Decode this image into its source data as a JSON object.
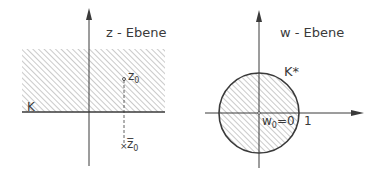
{
  "left_diagram": {
    "plane_label": "z - Ebene",
    "boundary_label": "K",
    "point_label": "z",
    "point_subscript": "0",
    "mirror_label": "z̅",
    "mirror_subscript": "0"
  },
  "right_diagram": {
    "plane_label": "w - Ebene",
    "boundary_label": "K*",
    "center_label": "w",
    "center_subscript": "0",
    "center_value": "=0",
    "unit_label": "1"
  },
  "colors": {
    "ink": "#3a3a3a",
    "hatch": "#8a8a8a",
    "background": "#ffffff"
  }
}
